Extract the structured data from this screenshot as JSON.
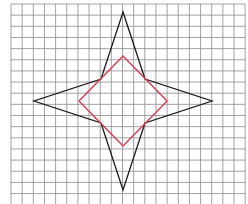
{
  "diagram": {
    "type": "grid-geometry",
    "grid": {
      "x_start": 11,
      "y_start": 4,
      "spacing": 11.15,
      "cols": 21,
      "rows": 18,
      "color": "#8c8c8c"
    },
    "star": {
      "color": "#1a1a1a",
      "points": [
        [
          123,
          12
        ],
        [
          145,
          79
        ],
        [
          212,
          101
        ],
        [
          145,
          123
        ],
        [
          123,
          190
        ],
        [
          101,
          123
        ],
        [
          34,
          101
        ],
        [
          101,
          79
        ]
      ]
    },
    "square": {
      "color": "#e03a52",
      "points": [
        [
          123,
          56
        ],
        [
          167,
          101
        ],
        [
          123,
          146
        ],
        [
          79,
          101
        ]
      ]
    }
  }
}
